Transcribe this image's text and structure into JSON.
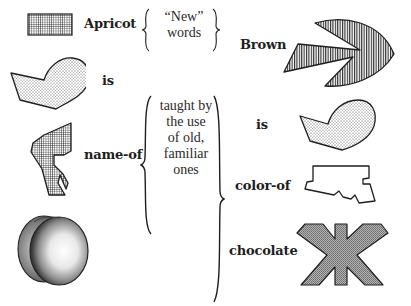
{
  "left_column": {
    "words": [
      {
        "label": "Apricot",
        "icon": "hatched-rectangle-icon"
      },
      {
        "label": "is",
        "icon": "dotted-heart-polygon-icon"
      },
      {
        "label": "name-of",
        "icon": "hatched-irregular-shape-icon"
      },
      {
        "label": "",
        "icon": "apricot-fruit-drawing-icon"
      }
    ]
  },
  "middle_column": {
    "top_note": {
      "line1": "“New”",
      "line2": "words"
    },
    "bottom_note": {
      "line1": "taught by",
      "line2": "the use",
      "line3": "of old,",
      "line4": "familiar",
      "line5": "ones"
    }
  },
  "right_column": {
    "words": [
      {
        "label": "Brown",
        "icon": "striped-pacman-shape-icon"
      },
      {
        "label": "is",
        "icon": "dotted-heart-polygon-icon"
      },
      {
        "label": "color-of",
        "icon": "outline-polygon-icon"
      },
      {
        "label": "chocolate",
        "icon": "gray-x-shape-icon"
      }
    ]
  },
  "colors": {
    "ink": "#1e1e1e",
    "fill_gray": "#9a9a9a",
    "background": "#ffffff"
  }
}
